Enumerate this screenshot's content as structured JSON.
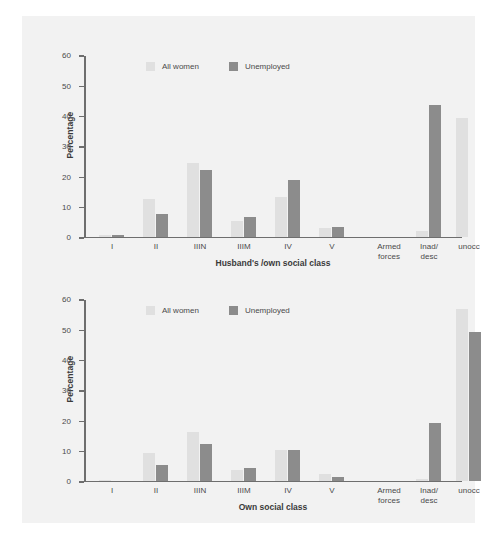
{
  "figure": {
    "background_color": "#f2f2f2",
    "light_series_color": "#e0e0e0",
    "dark_series_color": "#8c8c8c",
    "axis_color": "#6e6e6e"
  },
  "legend": {
    "items": [
      {
        "label": "All women",
        "color": "#e0e0e0"
      },
      {
        "label": "Unemployed",
        "color": "#8c8c8c"
      }
    ]
  },
  "chart_data": [
    {
      "type": "bar",
      "title": "",
      "xlabel": "Husband's /own social class",
      "ylabel": "Percentage",
      "ylim": [
        0,
        60
      ],
      "yticks": [
        0,
        10,
        20,
        30,
        40,
        50,
        60
      ],
      "grid": false,
      "legend_position": "top-left",
      "categories": [
        "I",
        "II",
        "IIIN",
        "IIIM",
        "IV",
        "V",
        "Armed forces",
        "Inad/ desc",
        "unocc"
      ],
      "series": [
        {
          "name": "All women",
          "values": [
            0.4,
            12.5,
            24.3,
            5.0,
            13.0,
            2.8,
            0,
            1.8,
            39.0
          ]
        },
        {
          "name": "Unemployed",
          "values": [
            0.4,
            7.5,
            21.8,
            6.3,
            18.5,
            3.0,
            0,
            43.5,
            0
          ]
        }
      ]
    },
    {
      "type": "bar",
      "title": "",
      "xlabel": "Own social class",
      "ylabel": "Percentage",
      "ylim": [
        0,
        60
      ],
      "yticks": [
        0,
        10,
        20,
        30,
        40,
        50,
        60
      ],
      "grid": false,
      "legend_position": "top-left",
      "categories": [
        "I",
        "II",
        "IIIN",
        "IIIM",
        "IV",
        "V",
        "Armed forces",
        "Inad/ desc",
        "unocc"
      ],
      "series": [
        {
          "name": "All women",
          "values": [
            0.3,
            9.0,
            16.0,
            3.5,
            10.0,
            2.3,
            0,
            0.4,
            56.5
          ]
        },
        {
          "name": "Unemployed",
          "values": [
            0.0,
            5.0,
            12.0,
            4.2,
            10.2,
            1.0,
            0,
            19.0,
            49.0
          ]
        }
      ]
    }
  ],
  "categories_display": [
    {
      "line1": "I",
      "line2": ""
    },
    {
      "line1": "II",
      "line2": ""
    },
    {
      "line1": "IIIN",
      "line2": ""
    },
    {
      "line1": "IIIM",
      "line2": ""
    },
    {
      "line1": "IV",
      "line2": ""
    },
    {
      "line1": "V",
      "line2": ""
    },
    {
      "line1": "Armed",
      "line2": "forces"
    },
    {
      "line1": "Inad/",
      "line2": "desc"
    },
    {
      "line1": "unocc",
      "line2": ""
    }
  ]
}
